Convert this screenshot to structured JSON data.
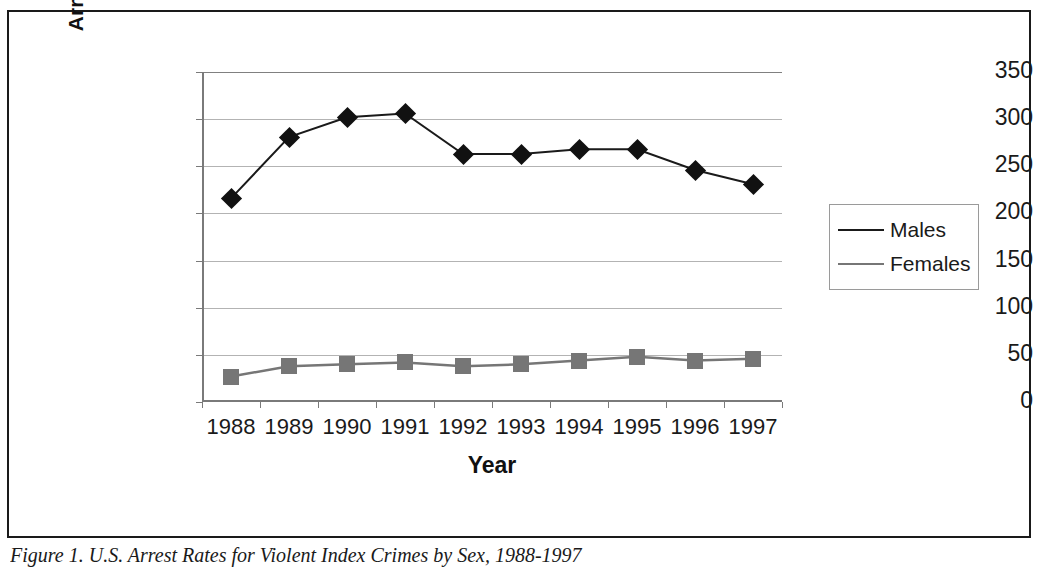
{
  "figure": {
    "caption": "Figure 1. U.S. Arrest Rates for Violent Index Crimes by Sex, 1988-1997"
  },
  "chart_data": {
    "type": "line",
    "title": "",
    "xlabel": "Year",
    "ylabel": "Arrests per 100,000 Total Population",
    "categories": [
      "1988",
      "1989",
      "1990",
      "1991",
      "1992",
      "1993",
      "1994",
      "1995",
      "1996",
      "1997"
    ],
    "series": [
      {
        "name": "Males",
        "marker": "diamond",
        "color": "#111111",
        "values": [
          216,
          281,
          302,
          306,
          263,
          263,
          268,
          268,
          246,
          231
        ]
      },
      {
        "name": "Females",
        "marker": "square",
        "color": "#767676",
        "values": [
          27,
          38,
          40,
          42,
          38,
          40,
          44,
          48,
          44,
          46
        ]
      }
    ],
    "ylim": [
      0,
      350
    ],
    "ytick_labels": [
      "0",
      "50",
      "100",
      "150",
      "200",
      "250",
      "300",
      "350"
    ],
    "ytick_values": [
      0,
      50,
      100,
      150,
      200,
      250,
      300,
      350
    ],
    "grid": true,
    "legend_position": "right",
    "legend_entries": [
      "Males",
      "Females"
    ]
  },
  "colors": {
    "males_line": "#1a1a1a",
    "females_line": "#767676",
    "gridline": "#b3b3b3",
    "axis": "#7a7a7a",
    "frame": "#1a1a1a"
  }
}
